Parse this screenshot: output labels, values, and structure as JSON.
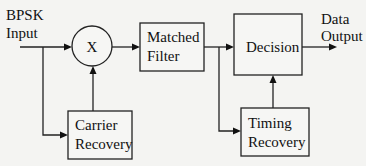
{
  "input_label": [
    "BPSK",
    "Input"
  ],
  "output_label": [
    "Data",
    "Output"
  ],
  "multiplier_symbol": "X",
  "blocks": {
    "matched_filter": [
      "Matched",
      "Filter"
    ],
    "decision": [
      "Decision"
    ],
    "carrier_recovery": [
      "Carrier",
      "Recovery"
    ],
    "timing_recovery": [
      "Timing",
      "Recovery"
    ]
  },
  "connections": [
    {
      "from": "BPSK Input",
      "to": "Multiplier"
    },
    {
      "from": "BPSK Input",
      "to": "Carrier Recovery"
    },
    {
      "from": "Carrier Recovery",
      "to": "Multiplier"
    },
    {
      "from": "Multiplier",
      "to": "Matched Filter"
    },
    {
      "from": "Matched Filter",
      "to": "Decision"
    },
    {
      "from": "Matched Filter",
      "to": "Timing Recovery"
    },
    {
      "from": "Timing Recovery",
      "to": "Decision"
    },
    {
      "from": "Decision",
      "to": "Data Output"
    }
  ]
}
